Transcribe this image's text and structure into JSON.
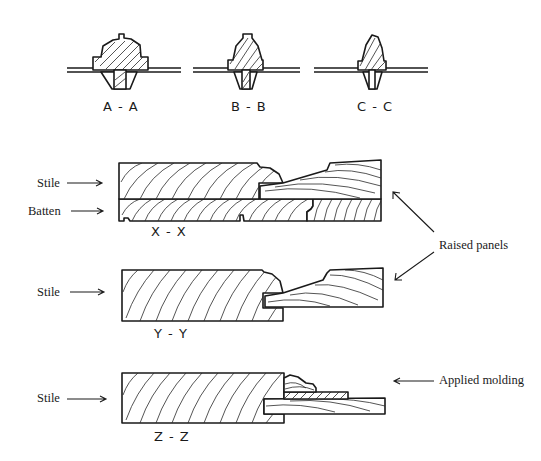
{
  "figure": {
    "sections_top": [
      {
        "id": "A-A",
        "label": "A - A"
      },
      {
        "id": "B-B",
        "label": "B - B"
      },
      {
        "id": "C-C",
        "label": "C - C"
      }
    ],
    "sections_main": [
      {
        "id": "X-X",
        "label": "X - X"
      },
      {
        "id": "Y-Y",
        "label": "Y - Y"
      },
      {
        "id": "Z-Z",
        "label": "Z - Z"
      }
    ],
    "callouts": {
      "stile_xx": "Stile",
      "batten_xx": "Batten",
      "stile_yy": "Stile",
      "stile_zz": "Stile",
      "raised_panels": "Raised panels",
      "applied_molding": "Applied molding"
    },
    "colors": {
      "ink": "#1a1a1a",
      "background": "#ffffff"
    }
  }
}
